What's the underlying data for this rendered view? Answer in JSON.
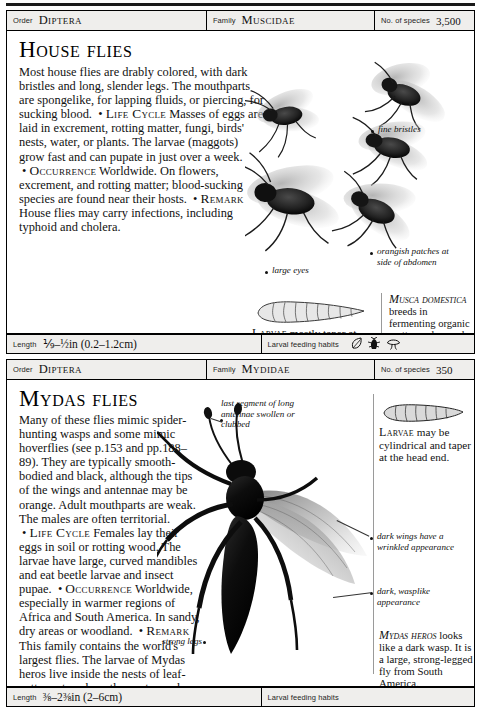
{
  "page": {
    "entries": [
      {
        "header": {
          "order_label": "Order",
          "order_value": "Diptera",
          "family_label": "Family",
          "family_value": "Muscidae",
          "species_label": "No. of species",
          "species_value": "3,500"
        },
        "title": "House flies",
        "intro": "Most house flies are drably colored, with dark bristles and long, slender legs. The mouthparts are spongelike, for lapping fluids, or piercing, for sucking blood.",
        "sections": [
          {
            "heading": "Life Cycle",
            "text": "Masses of eggs are laid in excrement, rotting matter, fungi, birds' nests, water, or plants. The larvae (maggots) grow fast and can pupate in just over a week."
          },
          {
            "heading": "Occurrence",
            "text": "Worldwide. On flowers, excrement, and rotting matter; blood-sucking species are found near their hosts."
          },
          {
            "heading": "Remark",
            "text": "House flies may carry infections, including typhoid and cholera."
          }
        ],
        "annotations": [
          {
            "name": "fine-bristles",
            "text": "fine bristles"
          },
          {
            "name": "large-eyes",
            "text": "large eyes"
          },
          {
            "name": "orangish-patches",
            "text": "orangish patches at side of abdomen"
          }
        ],
        "captions": [
          {
            "name": "larvae-caption",
            "lead": "Larvae",
            "text": " mostly taper at the head and are blunt at the rear."
          },
          {
            "name": "musca-domestica-caption",
            "lead": "Musca domestica",
            "text": " breeds in fermenting organic matter and spreads a variety of diseases, including cholera, typhoid, dysentery, and gastroenteritis."
          }
        ],
        "footer": {
          "length_label": "Length",
          "length_value": "⅑–½in (0.2–1.2cm)",
          "habits_label": "Larval feeding habits",
          "habit_icons": [
            "leaf-icon",
            "insect-prey-icon",
            "fungus-icon"
          ]
        }
      },
      {
        "header": {
          "order_label": "Order",
          "order_value": "Diptera",
          "family_label": "Family",
          "family_value": "Mydidae",
          "species_label": "No. of species",
          "species_value": "350"
        },
        "title": "Mydas flies",
        "intro": "Many of these flies mimic spider-hunting wasps and some mimic hoverflies (see p.153 and pp.188–89). They are typically smooth-bodied and black, although the tips of the wings and antennae may be orange. Adult mouthparts are weak. The males are often territorial.",
        "sections": [
          {
            "heading": "Life Cycle",
            "text": "Females lay their eggs in soil or rotting wood. The larvae have large, curved mandibles and eat beetle larvae and insect pupae."
          },
          {
            "heading": "Occurrence",
            "text": "Worldwide, especially in warmer regions of Africa and South America. In sandy, dry areas or woodland."
          },
          {
            "heading": "Remark",
            "text": "This family contains the world's largest flies. The larvae of Mydas heros live inside the nests of leaf-cutter ants, where they eat scarab beetle larvae."
          }
        ],
        "annotations": [
          {
            "name": "clubbed-antennae",
            "text": "last segment of long antennae swollen or clubbed"
          },
          {
            "name": "dark-wings",
            "text": "dark wings have a wrinkled appearance"
          },
          {
            "name": "dark-wasplike",
            "text": "dark, wasplike appearance"
          },
          {
            "name": "strong-legs",
            "text": "strong legs"
          }
        ],
        "captions": [
          {
            "name": "larvae-caption",
            "lead": "Larvae",
            "text": " may be cylindrical and taper at the head end."
          },
          {
            "name": "mydas-heros-caption",
            "lead": "Mydas heros",
            "text": " looks like a dark wasp. It is a large, strong-legged fly from South America."
          }
        ],
        "footer": {
          "length_label": "Length",
          "length_value": "⅜–2⅜in (2–6cm)",
          "habits_label": "Larval feeding habits",
          "habit_icons": []
        }
      }
    ]
  },
  "colors": {
    "rule": "#1a1a1a",
    "bar_fill": "#efeeec",
    "text": "#111111"
  }
}
